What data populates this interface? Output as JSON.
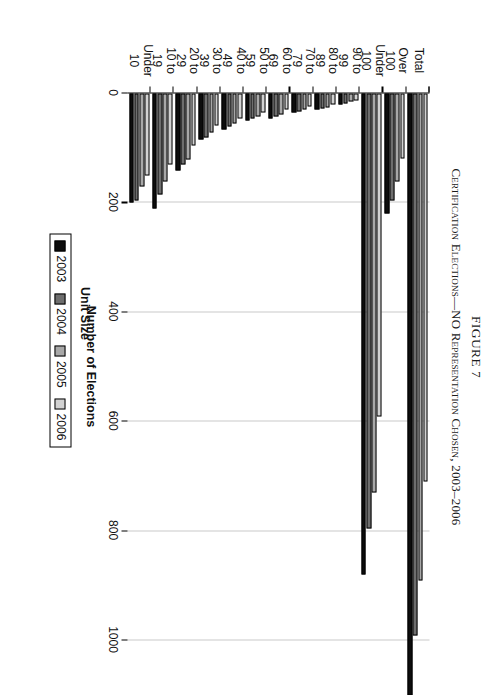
{
  "figure": {
    "number": "FIGURE 7",
    "title": "Certification Elections—NO Representation Chosen, 2003–2006"
  },
  "legend": {
    "title": "Unit Size",
    "entries": [
      {
        "label": "2003",
        "color": "#0d0d0d"
      },
      {
        "label": "2004",
        "color": "#6e6e6e"
      },
      {
        "label": "2005",
        "color": "#a8a8a8"
      },
      {
        "label": "2006",
        "color": "#d2d2d2"
      }
    ]
  },
  "axes": {
    "value_axis_title": "Number of Elections",
    "value_ticks": [
      "0",
      "200",
      "400",
      "600",
      "800",
      "1000"
    ]
  },
  "chart_data": {
    "type": "bar",
    "orientation": "horizontal",
    "title": "Certification Elections—NO Representation Chosen, 2003–2006",
    "xlabel": "Unit Size",
    "ylabel": "Number of Elections",
    "ylim": [
      0,
      1000
    ],
    "grid": true,
    "legend_position": "bottom-center",
    "categories": [
      "Under 10",
      "10 to 19",
      "20 to 29",
      "30 to 39",
      "40 to 49",
      "50 to 59",
      "60 to 69",
      "70 to 79",
      "80 to 89",
      "90 to 99",
      "Under 100",
      "Over 100",
      "Total"
    ],
    "series": [
      {
        "name": "2003",
        "color": "#0d0d0d",
        "values": [
          200,
          210,
          140,
          85,
          65,
          50,
          45,
          35,
          30,
          20,
          880,
          220,
          1100
        ]
      },
      {
        "name": "2004",
        "color": "#6e6e6e",
        "values": [
          195,
          185,
          130,
          80,
          60,
          45,
          42,
          32,
          28,
          18,
          795,
          195,
          990
        ]
      },
      {
        "name": "2005",
        "color": "#a8a8a8",
        "values": [
          170,
          160,
          120,
          72,
          55,
          42,
          38,
          30,
          25,
          15,
          730,
          160,
          890
        ]
      },
      {
        "name": "2006",
        "color": "#d2d2d2",
        "values": [
          150,
          130,
          95,
          58,
          45,
          35,
          30,
          24,
          20,
          12,
          590,
          118,
          710
        ]
      }
    ]
  }
}
